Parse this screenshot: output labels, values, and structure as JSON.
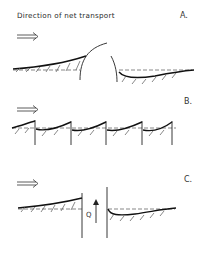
{
  "diagram": {
    "title": "Direction of net transport",
    "panels": [
      {
        "label": "A.",
        "description": "Single large groyne/breakwater with updrift accretion and downdrift erosion"
      },
      {
        "label": "B.",
        "description": "Series of groynes with sawtooth shoreline"
      },
      {
        "label": "C.",
        "description": "Jetties at inlet with bypass flow"
      }
    ],
    "flow_label": "Q",
    "arrow_symbol": "⟹"
  }
}
